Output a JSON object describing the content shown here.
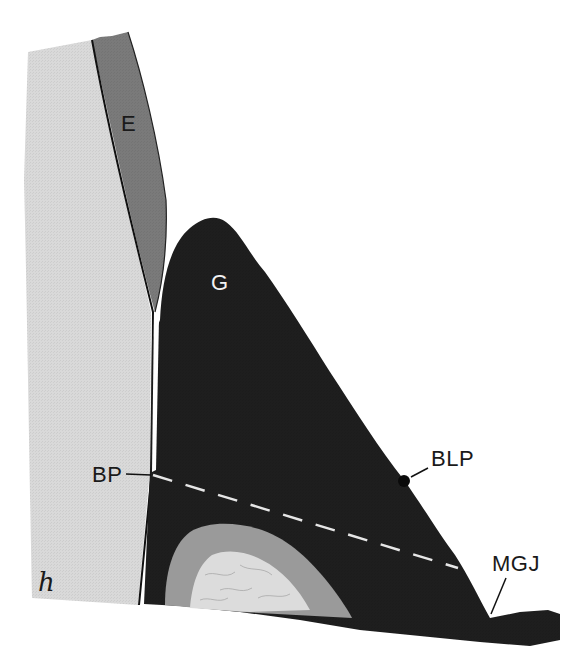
{
  "figure": {
    "type": "dental-periodontal-cross-section",
    "colors": {
      "background": "#ffffff",
      "tooth_root": "#d9d9d9",
      "enamel": "#7a7a7a",
      "gingiva": "#1e1e1e",
      "bone_outer": "#9a9a9a",
      "bone_inner": "#dcdcdc",
      "outline": "#111111",
      "dashed_line": "#e6e6e6"
    },
    "labels": {
      "enamel": "E",
      "gingiva": "G",
      "bone_peak": "BP",
      "bone_level_point": "BLP",
      "mucogingival_junction": "MGJ",
      "hand_mark": "h"
    }
  }
}
